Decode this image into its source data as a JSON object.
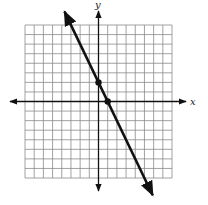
{
  "chart_data": {
    "type": "line",
    "title": "",
    "xlabel": "x",
    "ylabel": "y",
    "xlim": [
      -8,
      8
    ],
    "ylim": [
      -8,
      8
    ],
    "grid": true,
    "grid_step": 1,
    "series": [
      {
        "name": "line",
        "equation": "y = -2x + 2",
        "slope": -2,
        "intercept": 2,
        "points": [
          {
            "x": 0,
            "y": 2
          },
          {
            "x": 1,
            "y": 0
          }
        ],
        "extends_beyond_grid": true,
        "arrows_both_ends": true,
        "color": "#111111"
      }
    ]
  },
  "axes": {
    "x_label": "x",
    "y_label": "y"
  },
  "colors": {
    "grid": "#8a8a8a",
    "axis": "#111111",
    "line": "#111111",
    "background": "#ffffff"
  }
}
